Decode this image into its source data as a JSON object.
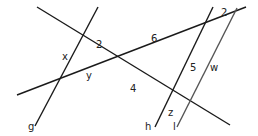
{
  "diagram": {
    "type": "intersecting-lines geometry figure",
    "colors": {
      "line": "#1a1a1a",
      "line_gray": "#555555",
      "text": "#222222",
      "background": "#ffffff"
    },
    "lines": [
      {
        "id": "g",
        "label": "g",
        "x1": 35,
        "y1": 126,
        "x2": 98,
        "y2": 7
      },
      {
        "id": "diag",
        "label": "",
        "x1": 37,
        "y1": 7,
        "x2": 230,
        "y2": 125
      },
      {
        "id": "transversal",
        "label": "",
        "x1": 17,
        "y1": 95,
        "x2": 246,
        "y2": 7
      },
      {
        "id": "h",
        "label": "h",
        "x1": 155,
        "y1": 127,
        "x2": 213,
        "y2": 7
      },
      {
        "id": "l",
        "label": "l",
        "x1": 177,
        "y1": 127,
        "x2": 237,
        "y2": 8
      }
    ],
    "labels": [
      {
        "name": "label-x",
        "text": "x",
        "x": 62,
        "y": 60
      },
      {
        "name": "label-2-left",
        "text": "2",
        "x": 96,
        "y": 48
      },
      {
        "name": "label-y",
        "text": "y",
        "x": 86,
        "y": 79
      },
      {
        "name": "label-6",
        "text": "6",
        "x": 151,
        "y": 42
      },
      {
        "name": "label-4",
        "text": "4",
        "x": 130,
        "y": 92
      },
      {
        "name": "label-5",
        "text": "5",
        "x": 190,
        "y": 71
      },
      {
        "name": "label-w",
        "text": "w",
        "x": 210,
        "y": 71
      },
      {
        "name": "label-2-right",
        "text": "2",
        "x": 221,
        "y": 16
      },
      {
        "name": "label-z",
        "text": "z",
        "x": 168,
        "y": 116
      },
      {
        "name": "label-g",
        "text": "g",
        "x": 28,
        "y": 130
      },
      {
        "name": "label-h",
        "text": "h",
        "x": 145,
        "y": 130
      },
      {
        "name": "label-l",
        "text": "l",
        "x": 173,
        "y": 130
      }
    ]
  }
}
